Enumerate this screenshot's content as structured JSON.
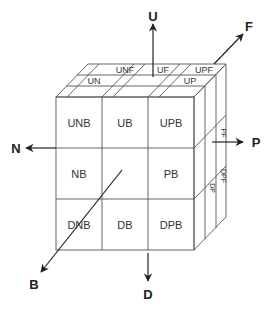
{
  "diagram": {
    "type": "cube-face-notation",
    "axes": {
      "up": "U",
      "down": "D",
      "north": "N",
      "positive": "P",
      "front": "F",
      "back": "B"
    },
    "front_face_cells": [
      [
        "UNB",
        "UB",
        "UPB"
      ],
      [
        "NB",
        "",
        "PB"
      ],
      [
        "DNB",
        "DB",
        "DPB"
      ]
    ],
    "top_face_cells": {
      "back_row": [
        "UN",
        "",
        "UP"
      ],
      "front_row": [
        "UNF",
        "UF",
        "UPF"
      ]
    },
    "right_face_cells": {
      "middle": [
        "PF"
      ],
      "bottom": [
        "DP",
        "DPF"
      ]
    }
  }
}
